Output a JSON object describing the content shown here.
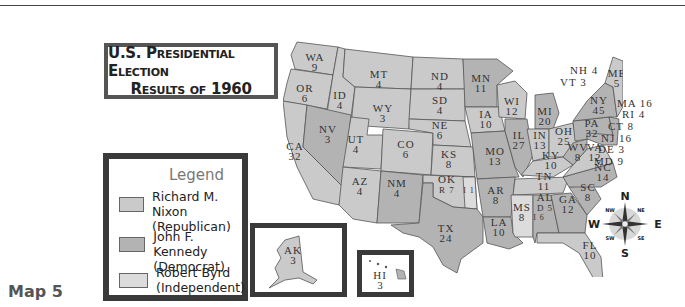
{
  "title": {
    "line1": "U.S. Presidential Election",
    "line2": "Results of 1960"
  },
  "legend": {
    "title": "Legend",
    "items": [
      {
        "label1": "Richard M. Nixon",
        "label2": "(Republican)",
        "color": "#cacaca"
      },
      {
        "label1": "John F. Kennedy",
        "label2": "(Democrat)",
        "color": "#b3b3b3"
      },
      {
        "label1": "Robert Byrd",
        "label2": "(Independent)",
        "color": "#dcdcdc"
      }
    ]
  },
  "map_label": "Map 5",
  "colors": {
    "republican": "#cacaca",
    "democrat": "#b3b3b3",
    "independent": "#dcdcdc",
    "border": "#555555"
  },
  "states": [
    {
      "abbr": "WA",
      "votes": "9",
      "party": "R"
    },
    {
      "abbr": "OR",
      "votes": "6",
      "party": "R"
    },
    {
      "abbr": "CA",
      "votes": "32",
      "party": "R"
    },
    {
      "abbr": "ID",
      "votes": "4",
      "party": "R"
    },
    {
      "abbr": "NV",
      "votes": "3",
      "party": "D"
    },
    {
      "abbr": "MT",
      "votes": "4",
      "party": "R"
    },
    {
      "abbr": "WY",
      "votes": "3",
      "party": "R"
    },
    {
      "abbr": "UT",
      "votes": "4",
      "party": "R"
    },
    {
      "abbr": "CO",
      "votes": "6",
      "party": "R"
    },
    {
      "abbr": "AZ",
      "votes": "4",
      "party": "R"
    },
    {
      "abbr": "NM",
      "votes": "4",
      "party": "D"
    },
    {
      "abbr": "ND",
      "votes": "4",
      "party": "R"
    },
    {
      "abbr": "SD",
      "votes": "4",
      "party": "R"
    },
    {
      "abbr": "NE",
      "votes": "6",
      "party": "R"
    },
    {
      "abbr": "KS",
      "votes": "8",
      "party": "R"
    },
    {
      "abbr": "OK",
      "votes": "R 7 / I 1",
      "party": "R"
    },
    {
      "abbr": "TX",
      "votes": "24",
      "party": "D"
    },
    {
      "abbr": "MN",
      "votes": "11",
      "party": "D"
    },
    {
      "abbr": "IA",
      "votes": "10",
      "party": "R"
    },
    {
      "abbr": "MO",
      "votes": "13",
      "party": "D"
    },
    {
      "abbr": "AR",
      "votes": "8",
      "party": "D"
    },
    {
      "abbr": "LA",
      "votes": "10",
      "party": "D"
    },
    {
      "abbr": "WI",
      "votes": "12",
      "party": "R"
    },
    {
      "abbr": "IL",
      "votes": "27",
      "party": "D"
    },
    {
      "abbr": "MI",
      "votes": "20",
      "party": "D"
    },
    {
      "abbr": "IN",
      "votes": "13",
      "party": "R"
    },
    {
      "abbr": "OH",
      "votes": "25",
      "party": "R"
    },
    {
      "abbr": "KY",
      "votes": "10",
      "party": "R"
    },
    {
      "abbr": "TN",
      "votes": "11",
      "party": "R"
    },
    {
      "abbr": "MS",
      "votes": "8",
      "party": "I"
    },
    {
      "abbr": "AL",
      "votes": "D 5 / I 6",
      "party": "D"
    },
    {
      "abbr": "GA",
      "votes": "12",
      "party": "D"
    },
    {
      "abbr": "FL",
      "votes": "10",
      "party": "R"
    },
    {
      "abbr": "SC",
      "votes": "8",
      "party": "D"
    },
    {
      "abbr": "NC",
      "votes": "14",
      "party": "D"
    },
    {
      "abbr": "VA",
      "votes": "12",
      "party": "R"
    },
    {
      "abbr": "WV",
      "votes": "8",
      "party": "D"
    },
    {
      "abbr": "PA",
      "votes": "32",
      "party": "D"
    },
    {
      "abbr": "NY",
      "votes": "45",
      "party": "D"
    },
    {
      "abbr": "VT",
      "votes": "3",
      "party": "R"
    },
    {
      "abbr": "NH",
      "votes": "4",
      "party": "R"
    },
    {
      "abbr": "ME",
      "votes": "5",
      "party": "R"
    },
    {
      "abbr": "MA",
      "votes": "16",
      "party": "D"
    },
    {
      "abbr": "RI",
      "votes": "4",
      "party": "D"
    },
    {
      "abbr": "CT",
      "votes": "8",
      "party": "D"
    },
    {
      "abbr": "NJ",
      "votes": "16",
      "party": "D"
    },
    {
      "abbr": "DE",
      "votes": "3",
      "party": "D"
    },
    {
      "abbr": "MD",
      "votes": "9",
      "party": "D"
    },
    {
      "abbr": "AK",
      "votes": "3",
      "party": "R"
    },
    {
      "abbr": "HI",
      "votes": "3",
      "party": "D"
    }
  ],
  "labels": {
    "WA": "WA",
    "WA_v": "9",
    "OR": "OR",
    "OR_v": "6",
    "CA": "CA",
    "CA_v": "32",
    "ID": "ID",
    "ID_v": "4",
    "NV": "NV",
    "NV_v": "3",
    "MT": "MT",
    "MT_v": "4",
    "WY": "WY",
    "WY_v": "3",
    "UT": "UT",
    "UT_v": "4",
    "CO": "CO",
    "CO_v": "6",
    "AZ": "AZ",
    "AZ_v": "4",
    "NM": "NM",
    "NM_v": "4",
    "ND": "ND",
    "ND_v": "4",
    "SD": "SD",
    "SD_v": "4",
    "NE": "NE",
    "NE_v": "6",
    "KS": "KS",
    "KS_v": "8",
    "OK": "OK",
    "OK_v": "R 7",
    "OK_i": "I 1",
    "TX": "TX",
    "TX_v": "24",
    "MN": "MN",
    "MN_v": "11",
    "IA": "IA",
    "IA_v": "10",
    "MO": "MO",
    "MO_v": "13",
    "AR": "AR",
    "AR_v": "8",
    "LA": "LA",
    "LA_v": "10",
    "WI": "WI",
    "WI_v": "12",
    "IL": "IL",
    "IL_v": "27",
    "MI": "MI",
    "MI_v": "20",
    "IN": "IN",
    "IN_v": "13",
    "OH": "OH",
    "OH_v": "25",
    "KY": "KY",
    "KY_v": "10",
    "TN": "TN",
    "TN_v": "11",
    "MS": "MS",
    "MS_v": "8",
    "AL": "AL",
    "AL_v": "D 5",
    "AL_i": "I 6",
    "GA": "GA",
    "GA_v": "12",
    "FL": "FL",
    "FL_v": "10",
    "SC": "SC",
    "SC_v": "8",
    "NC": "NC",
    "NC_v": "14",
    "VA": "VA",
    "VA_v": "12",
    "WV": "WV",
    "WV_v": "8",
    "PA": "PA",
    "PA_v": "32",
    "NY": "NY",
    "NY_v": "45",
    "ME": "ME",
    "ME_v": "5",
    "NH_c": "NH 4",
    "VT_c": "VT 3",
    "MA_c": "MA 16",
    "RI_c": "RI 4",
    "CT_c": "CT 8",
    "NJ_c": "NJ 16",
    "DE_c": "DE 3",
    "MD_c": "MD 9",
    "AK": "AK",
    "AK_v": "3",
    "HI": "HI",
    "HI_v": "3"
  },
  "compass": {
    "N": "N",
    "S": "S",
    "E": "E",
    "W": "W",
    "NE": "NE",
    "NW": "NW",
    "SE": "SE",
    "SW": "SW"
  }
}
